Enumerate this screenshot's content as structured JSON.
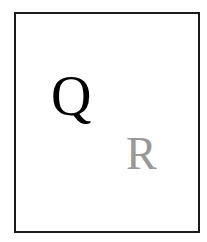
{
  "diagram": {
    "letters": [
      {
        "label": "Q",
        "color": "#000000"
      },
      {
        "label": "R",
        "color": "#999999"
      }
    ],
    "frame_color": "#1a1a1a"
  }
}
